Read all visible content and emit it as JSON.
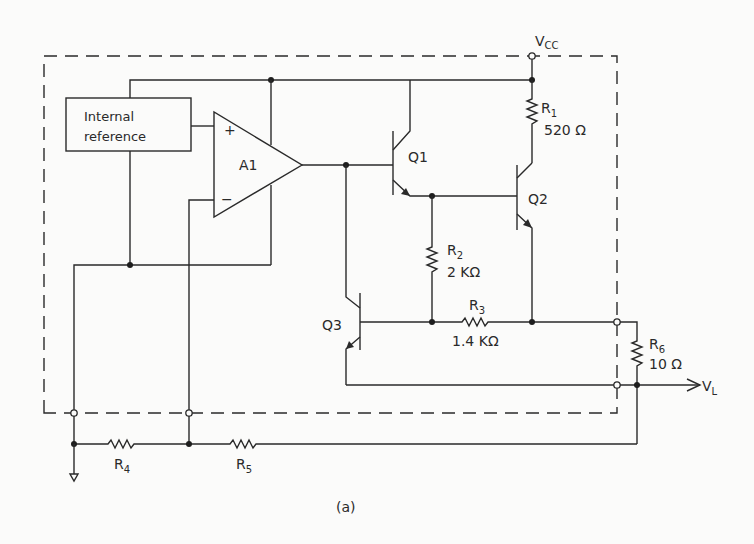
{
  "figure": {
    "caption": "(a)"
  },
  "supply": {
    "label": "V",
    "subscript": "CC"
  },
  "output": {
    "label": "V",
    "subscript": "L"
  },
  "blocks": {
    "internal_reference": {
      "line1": "Internal",
      "line2": "reference"
    },
    "amplifier": {
      "label": "A1",
      "plus": "+",
      "minus": "−"
    }
  },
  "transistors": [
    {
      "id": "Q1",
      "label": "Q1",
      "type": "NPN"
    },
    {
      "id": "Q2",
      "label": "Q2",
      "type": "NPN"
    },
    {
      "id": "Q3",
      "label": "Q3",
      "type": "PNP"
    }
  ],
  "resistors": [
    {
      "id": "R1",
      "name": "R",
      "sub": "1",
      "value": "520 Ω"
    },
    {
      "id": "R2",
      "name": "R",
      "sub": "2",
      "value": "2 KΩ"
    },
    {
      "id": "R3",
      "name": "R",
      "sub": "3",
      "value": "1.4 KΩ"
    },
    {
      "id": "R4",
      "name": "R",
      "sub": "4",
      "value": ""
    },
    {
      "id": "R5",
      "name": "R",
      "sub": "5",
      "value": ""
    },
    {
      "id": "R6",
      "name": "R",
      "sub": "6",
      "value": "10 Ω"
    }
  ],
  "colors": {
    "ink": "#2a2a2a",
    "paper": "#fbfbfa"
  }
}
